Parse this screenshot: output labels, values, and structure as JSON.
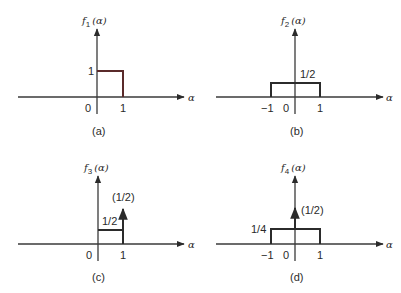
{
  "figure": {
    "colors": {
      "axis": "#3a3a3a",
      "signal": "#2b2b2b",
      "signal_a": "#5a2a2a",
      "text": "#2a2a2a"
    },
    "axis_variable": "α",
    "panels": [
      {
        "id": "a",
        "caption": "(a)",
        "ylabel_f": "f",
        "ylabel_sub": "1",
        "ylabel_arg": "(α)",
        "tick_labels": {
          "zero": "0",
          "one": "1"
        },
        "level_label": "1",
        "description": "Rectangular pulse of height 1 on [0,1]"
      },
      {
        "id": "b",
        "caption": "(b)",
        "ylabel_f": "f",
        "ylabel_sub": "2",
        "ylabel_arg": "(α)",
        "tick_labels": {
          "neg_one": "−1",
          "zero": "0",
          "one": "1"
        },
        "level_label": "1/2",
        "description": "Rectangular pulse of height 1/2 on [-1,1]"
      },
      {
        "id": "c",
        "caption": "(c)",
        "ylabel_f": "f",
        "ylabel_sub": "3",
        "ylabel_arg": "(α)",
        "tick_labels": {
          "zero": "0",
          "one": "1"
        },
        "level_label": "1/2",
        "impulse_label": "(1/2)",
        "description": "Pulse of height 1/2 on [0,1) plus impulse of weight 1/2 at α=1"
      },
      {
        "id": "d",
        "caption": "(d)",
        "ylabel_f": "f",
        "ylabel_sub": "4",
        "ylabel_arg": "(α)",
        "tick_labels": {
          "neg_one": "−1",
          "zero": "0",
          "one": "1"
        },
        "level_label": "1/4",
        "impulse_label": "(1/2)",
        "description": "Pulse of height 1/4 on [-1,1] plus impulse of weight 1/2 at α=0"
      }
    ]
  }
}
